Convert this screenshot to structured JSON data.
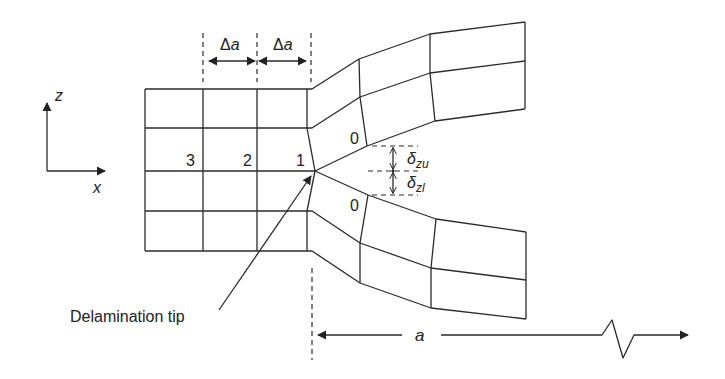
{
  "diagram": {
    "axes": {
      "vertical": "z",
      "horizontal": "x"
    },
    "increments": [
      {
        "label": "Δ",
        "var": "a"
      },
      {
        "label": "Δ",
        "var": "a"
      }
    ],
    "node_labels": {
      "n3": "3",
      "n2": "2",
      "n1": "1",
      "n0_upper": "0",
      "n0_lower": "0"
    },
    "displacements": {
      "upper": {
        "symbol": "δ",
        "sub": "zu"
      },
      "lower": {
        "symbol": "δ",
        "sub": "zl"
      }
    },
    "tip_label": "Delamination tip",
    "crack_length": "a",
    "colors": {
      "line": "#2a2a2a",
      "background": "#ffffff"
    }
  }
}
